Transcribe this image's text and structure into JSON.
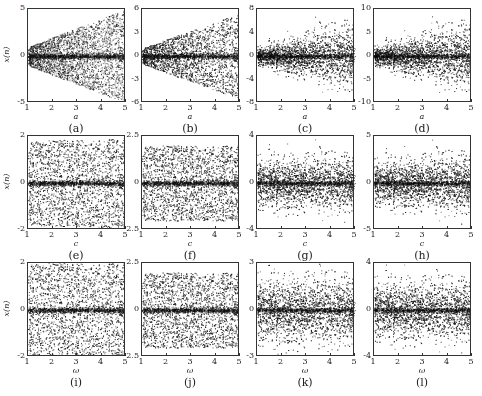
{
  "chart_data": [
    {
      "panel": "a",
      "caption": "(a)",
      "type": "scatter",
      "xlabel": "a",
      "ylabel": "x(n)",
      "xlim": [
        1,
        5
      ],
      "ylim": [
        -5,
        5
      ],
      "xticks": [
        "1",
        "2",
        "3",
        "4",
        "5"
      ],
      "yticks": [
        "5",
        "0",
        "-5"
      ],
      "ytick_values": [
        5,
        0,
        -5
      ],
      "envelope": {
        "start": 1.0,
        "end": 5.0
      },
      "shape": "wedge",
      "description": "Cone-shaped spread widening linearly with a, dense band at 0"
    },
    {
      "panel": "b",
      "caption": "(b)",
      "type": "scatter",
      "xlabel": "a",
      "ylabel": "x(n)",
      "xlim": [
        1,
        5
      ],
      "ylim": [
        -6,
        6
      ],
      "xticks": [
        "1",
        "2",
        "3",
        "4",
        "5"
      ],
      "yticks": [
        "6",
        "3",
        "0",
        "-3",
        "-6"
      ],
      "ytick_values": [
        6,
        3,
        0,
        -3,
        -6
      ],
      "envelope": {
        "start": 1.0,
        "end": 5.5
      },
      "shape": "wedge",
      "description": "Wedge spread widening with a"
    },
    {
      "panel": "c",
      "caption": "(c)",
      "type": "scatter",
      "xlabel": "a",
      "ylabel": "x(n)",
      "xlim": [
        1,
        5
      ],
      "ylim": [
        -8,
        8
      ],
      "xticks": [
        "1",
        "2",
        "3",
        "4",
        "5"
      ],
      "yticks": [
        "8",
        "4",
        "0",
        "-4",
        "-8"
      ],
      "ytick_values": [
        8,
        4,
        0,
        -4,
        -8
      ],
      "envelope": {
        "start": 1.5,
        "end": 6.0
      },
      "shape": "gaussian-wedge",
      "description": "Soft-edged spread widening with a"
    },
    {
      "panel": "d",
      "caption": "(d)",
      "type": "scatter",
      "xlabel": "a",
      "ylabel": "x(n)",
      "xlim": [
        1,
        5
      ],
      "ylim": [
        -10,
        10
      ],
      "xticks": [
        "1",
        "2",
        "3",
        "4",
        "5"
      ],
      "yticks": [
        "10",
        "5",
        "0",
        "-5",
        "-10"
      ],
      "ytick_values": [
        10,
        5,
        0,
        -5,
        -10
      ],
      "envelope": {
        "start": 2.0,
        "end": 7.5
      },
      "shape": "gaussian-wedge",
      "description": "Soft-edged spread widening with a"
    },
    {
      "panel": "e",
      "caption": "(e)",
      "type": "scatter",
      "xlabel": "c",
      "ylabel": "x(n)",
      "xlim": [
        1,
        5
      ],
      "ylim": [
        -2,
        2
      ],
      "xticks": [
        "1",
        "2",
        "3",
        "4",
        "5"
      ],
      "yticks": [
        "2",
        "0",
        "-2"
      ],
      "ytick_values": [
        2,
        0,
        -2
      ],
      "envelope": {
        "start": 1.8,
        "end": 1.9
      },
      "shape": "band",
      "description": "Uniform band filling range, bifurcation structure near c=1.3-2.1, dense line at 0"
    },
    {
      "panel": "f",
      "caption": "(f)",
      "type": "scatter",
      "xlabel": "c",
      "ylabel": "x(n)",
      "xlim": [
        1,
        5
      ],
      "ylim": [
        -2.5,
        2.5
      ],
      "xticks": [
        "1",
        "2",
        "3",
        "4",
        "5"
      ],
      "yticks": [
        "2.5",
        "0",
        "-2.5"
      ],
      "ytick_values": [
        2.5,
        0,
        -2.5
      ],
      "envelope": {
        "start": 2.0,
        "end": 2.0
      },
      "shape": "band",
      "description": "Band about ±2, slight bulge near c=3"
    },
    {
      "panel": "g",
      "caption": "(g)",
      "type": "scatter",
      "xlabel": "c",
      "ylabel": "x(n)",
      "xlim": [
        1,
        5
      ],
      "ylim": [
        -4,
        4
      ],
      "xticks": [
        "1",
        "2",
        "3",
        "4",
        "5"
      ],
      "yticks": [
        "4",
        "0",
        "-4"
      ],
      "ytick_values": [
        4,
        0,
        -4
      ],
      "envelope": {
        "start": 2.2,
        "end": 2.4
      },
      "shape": "gaussian-band",
      "description": "Gaussian-like band about ±2.5"
    },
    {
      "panel": "h",
      "caption": "(h)",
      "type": "scatter",
      "xlabel": "c",
      "ylabel": "x(n)",
      "xlim": [
        1,
        5
      ],
      "ylim": [
        -5,
        5
      ],
      "xticks": [
        "1",
        "2",
        "3",
        "4",
        "5"
      ],
      "yticks": [
        "5",
        "0",
        "-5"
      ],
      "ytick_values": [
        5,
        0,
        -5
      ],
      "envelope": {
        "start": 2.4,
        "end": 3.2
      },
      "shape": "gaussian-band",
      "description": "Gaussian-like band slowly widening"
    },
    {
      "panel": "i",
      "caption": "(i)",
      "type": "scatter",
      "xlabel": "ω",
      "ylabel": "x(n)",
      "xlim": [
        1,
        5
      ],
      "ylim": [
        -2,
        2
      ],
      "xticks": [
        "1",
        "2",
        "3",
        "4",
        "5"
      ],
      "yticks": [
        "2",
        "0",
        "-2"
      ],
      "ytick_values": [
        2,
        0,
        -2
      ],
      "envelope": {
        "start": 2.0,
        "end": 2.0
      },
      "shape": "band",
      "description": "Uniform band filling range, dense line at 0"
    },
    {
      "panel": "j",
      "caption": "(j)",
      "type": "scatter",
      "xlabel": "ω",
      "ylabel": "x(n)",
      "xlim": [
        1,
        5
      ],
      "ylim": [
        -2.5,
        2.5
      ],
      "xticks": [
        "1",
        "2",
        "3",
        "4",
        "5"
      ],
      "yticks": [
        "2.5",
        "0",
        "-2.5"
      ],
      "ytick_values": [
        2.5,
        0,
        -2.5
      ],
      "envelope": {
        "start": 2.0,
        "end": 2.0
      },
      "shape": "band",
      "description": "Band about ±2"
    },
    {
      "panel": "k",
      "caption": "(k)",
      "type": "scatter",
      "xlabel": "ω",
      "ylabel": "x(n)",
      "xlim": [
        1,
        5
      ],
      "ylim": [
        -3,
        3
      ],
      "xticks": [
        "1",
        "2",
        "3",
        "4",
        "5"
      ],
      "yticks": [
        "3",
        "0",
        "-3"
      ],
      "ytick_values": [
        3,
        0,
        -3
      ],
      "envelope": {
        "start": 2.2,
        "end": 2.2
      },
      "shape": "gaussian-band",
      "description": "Gaussian-like band"
    },
    {
      "panel": "l",
      "caption": "(l)",
      "type": "scatter",
      "xlabel": "ω",
      "ylabel": "x(n)",
      "xlim": [
        1,
        5
      ],
      "ylim": [
        -4,
        4
      ],
      "xticks": [
        "1",
        "2",
        "3",
        "4",
        "5"
      ],
      "yticks": [
        "4",
        "0",
        "-4"
      ],
      "ytick_values": [
        4,
        0,
        -4
      ],
      "envelope": {
        "start": 2.6,
        "end": 2.6
      },
      "shape": "gaussian-band",
      "description": "Gaussian-like band"
    }
  ],
  "layout": {
    "cols_x": [
      27,
      141,
      256,
      373
    ],
    "frame_width": 98,
    "rows_y": [
      8,
      135,
      262
    ],
    "frame_height": 94,
    "ink": "#1a1a1a"
  }
}
